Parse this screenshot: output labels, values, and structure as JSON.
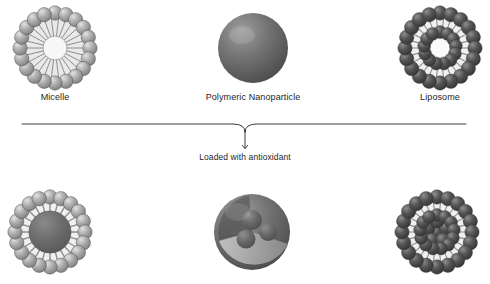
{
  "figure": {
    "background_color": "#ffffff",
    "width": 490,
    "height": 284
  },
  "top_row": {
    "items": [
      {
        "id": "micelle",
        "label": "Micelle",
        "structure": "monolayer-corona",
        "center_x": 55,
        "center_y": 48,
        "radius": 43,
        "bead_count": 20,
        "bead_color": "#9a9a9a",
        "bead_highlight": "#d8d8d8",
        "tail_color": "#e9e9e9",
        "core_color": "#f6f6f6",
        "loaded": false
      },
      {
        "id": "polymeric-nanoparticle",
        "label": "Polymeric Nanoparticle",
        "structure": "solid-sphere",
        "center_x": 253,
        "center_y": 48,
        "radius": 35,
        "sphere_color": "#6c6c6c",
        "sphere_highlight": "#9a9a9a",
        "sphere_shadow": "#4a4a4a",
        "loaded": false
      },
      {
        "id": "liposome",
        "label": "Liposome",
        "structure": "bilayer-vesicle",
        "center_x": 440,
        "center_y": 48,
        "radius": 43,
        "outer_bead_count": 20,
        "inner_bead_count": 13,
        "bead_color": "#4a4a4a",
        "bead_highlight": "#7d7d7d",
        "tail_color": "#f0f0f0",
        "core_color": "#fafafa",
        "loaded": false
      }
    ]
  },
  "divider": {
    "id": "process-divider",
    "x_start": 22,
    "x_end": 466,
    "y": 124,
    "color": "#3a3a3a",
    "stroke_width": 1
  },
  "arrow": {
    "id": "loading-arrow",
    "x": 245,
    "y_start": 124,
    "y_end": 148,
    "color": "#3a3a3a",
    "label": "Loaded with antioxidant",
    "label_x": 245,
    "label_y": 154
  },
  "bottom_row": {
    "items": [
      {
        "id": "micelle-loaded",
        "label": "",
        "structure": "monolayer-corona",
        "center_x": 50,
        "center_y": 232,
        "radius": 43,
        "bead_count": 20,
        "bead_color": "#9a9a9a",
        "bead_highlight": "#d8d8d8",
        "tail_color": "#f0f0f0",
        "core_color": "#6a6a6a",
        "loaded": true,
        "cargo": "solid-core"
      },
      {
        "id": "polymeric-nanoparticle-loaded",
        "label": "",
        "structure": "cutaway-sphere",
        "center_x": 252,
        "center_y": 232,
        "radius": 38,
        "sphere_color": "#6c6c6c",
        "sphere_highlight": "#9a9a9a",
        "sphere_shadow": "#4a4a4a",
        "loaded": true,
        "cargo": "three-inner-spheres",
        "cargo_count": 3
      },
      {
        "id": "liposome-loaded",
        "label": "",
        "structure": "bilayer-vesicle",
        "center_x": 437,
        "center_y": 232,
        "radius": 43,
        "outer_bead_count": 20,
        "inner_bead_count": 13,
        "bead_color": "#4a4a4a",
        "bead_highlight": "#7d7d7d",
        "tail_color": "#f0f0f0",
        "core_color": "#4f4f4f",
        "loaded": true,
        "cargo": "filled-lumen"
      }
    ]
  }
}
